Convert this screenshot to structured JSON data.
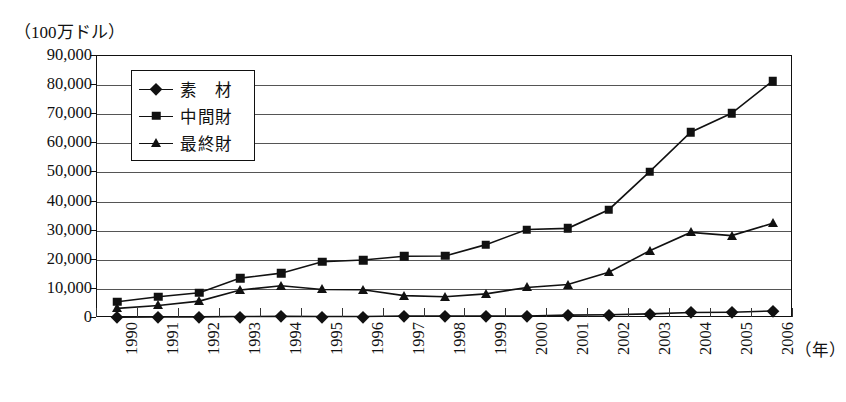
{
  "chart_data": {
    "type": "line",
    "title": "",
    "unit_caption": "（100万ドル）",
    "xlabel": "（年）",
    "ylabel": "",
    "grid": true,
    "legend_position": "inside-top-left",
    "ylim": [
      0,
      90000
    ],
    "ytick_labels": [
      "90,000",
      "80,000",
      "70,000",
      "60,000",
      "50,000",
      "40,000",
      "30,000",
      "20,000",
      "10,000",
      "0"
    ],
    "ytick_values": [
      90000,
      80000,
      70000,
      60000,
      50000,
      40000,
      30000,
      20000,
      10000,
      0
    ],
    "categories": [
      "1990",
      "1991",
      "1992",
      "1993",
      "1994",
      "1995",
      "1996",
      "1997",
      "1998",
      "1999",
      "2000",
      "2001",
      "2002",
      "2003",
      "2004",
      "2005",
      "2006"
    ],
    "series": [
      {
        "name": "素　材",
        "marker": "diamond",
        "color": "#111111",
        "values": [
          300,
          350,
          400,
          500,
          550,
          500,
          500,
          700,
          700,
          700,
          700,
          1000,
          1100,
          1400,
          1900,
          2000,
          2400
        ]
      },
      {
        "name": "中間財",
        "marker": "square",
        "color": "#111111",
        "values": [
          5600,
          7300,
          8700,
          13700,
          15400,
          19300,
          19900,
          21200,
          21300,
          25200,
          30400,
          30800,
          37200,
          50300,
          63800,
          70300,
          81400
        ]
      },
      {
        "name": "最終財",
        "marker": "triangle",
        "color": "#111111",
        "values": [
          3300,
          4300,
          5800,
          9600,
          11100,
          9800,
          9700,
          7700,
          7300,
          8300,
          10500,
          11500,
          15700,
          23100,
          29400,
          28300,
          32500
        ]
      }
    ]
  },
  "legend": {
    "items": [
      {
        "label": "素　材",
        "marker": "diamond"
      },
      {
        "label": "中間財",
        "marker": "square"
      },
      {
        "label": "最終財",
        "marker": "triangle"
      }
    ]
  }
}
